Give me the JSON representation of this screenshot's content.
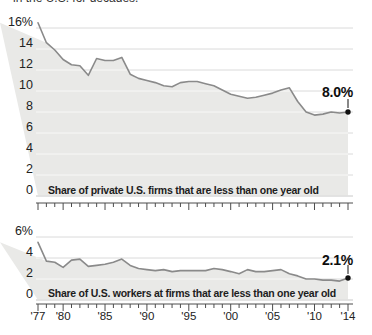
{
  "header": {
    "clipped_text": "in the U.S. for decades."
  },
  "colors": {
    "area_fill": "#e9e9e7",
    "line": "#8a8a8a",
    "grid": "#dadada",
    "grid_on_fill": "rgba(255,255,255,0.7)",
    "dot": "#111111",
    "axis": "#4d4d4d",
    "tick_text": "#222222",
    "label_text": "#1d1d1d"
  },
  "chart_data": [
    {
      "type": "area",
      "name": "firms-startup-share",
      "title": "Share of private U.S. firms that are less than one year old",
      "x": [
        1977,
        1978,
        1979,
        1980,
        1981,
        1982,
        1983,
        1984,
        1985,
        1986,
        1987,
        1988,
        1989,
        1990,
        1991,
        1992,
        1993,
        1994,
        1995,
        1996,
        1997,
        1998,
        1999,
        2000,
        2001,
        2002,
        2003,
        2004,
        2005,
        2006,
        2007,
        2008,
        2009,
        2010,
        2011,
        2012,
        2013,
        2014
      ],
      "values": [
        16.5,
        14.6,
        13.9,
        13.0,
        12.5,
        12.4,
        11.5,
        13.1,
        12.9,
        12.9,
        13.2,
        11.6,
        11.2,
        11.0,
        10.8,
        10.5,
        10.4,
        10.8,
        10.9,
        10.9,
        10.7,
        10.5,
        10.1,
        9.7,
        9.5,
        9.3,
        9.4,
        9.6,
        9.8,
        10.1,
        10.3,
        9.0,
        8.0,
        7.7,
        7.8,
        8.0,
        7.9,
        8.0
      ],
      "ylim": [
        0,
        17
      ],
      "yticks": [
        16,
        14,
        12,
        10,
        8,
        6,
        4,
        2,
        0
      ],
      "ytick_labels": [
        "16%",
        "14",
        "12",
        "10",
        "8",
        "6",
        "4",
        "2",
        "0"
      ],
      "xtick_years": [
        1977,
        1980,
        1985,
        1990,
        1995,
        2000,
        2005,
        2010,
        2014
      ],
      "xtick_labels": [
        "'77",
        "'80",
        "'85",
        "'90",
        "'95",
        "'00",
        "'05",
        "'10",
        "'14"
      ],
      "show_x_labels": false,
      "grid": true,
      "legend": "none",
      "end_annotation": {
        "label": "8.0%",
        "year": 2014,
        "value": 8.0
      }
    },
    {
      "type": "area",
      "name": "workers-startup-share",
      "title": "Share of U.S. workers at firms that are less than one year old",
      "x": [
        1977,
        1978,
        1979,
        1980,
        1981,
        1982,
        1983,
        1984,
        1985,
        1986,
        1987,
        1988,
        1989,
        1990,
        1991,
        1992,
        1993,
        1994,
        1995,
        1996,
        1997,
        1998,
        1999,
        2000,
        2001,
        2002,
        2003,
        2004,
        2005,
        2006,
        2007,
        2008,
        2009,
        2010,
        2011,
        2012,
        2013,
        2014
      ],
      "values": [
        5.5,
        3.7,
        3.6,
        3.1,
        3.8,
        3.9,
        3.2,
        3.3,
        3.4,
        3.6,
        3.9,
        3.3,
        3.0,
        2.9,
        2.8,
        2.9,
        2.7,
        2.8,
        2.8,
        2.8,
        2.8,
        3.0,
        2.9,
        2.7,
        2.5,
        2.9,
        2.7,
        2.7,
        2.8,
        2.9,
        2.5,
        2.3,
        2.0,
        2.0,
        1.9,
        1.9,
        1.8,
        2.1
      ],
      "ylim": [
        0,
        6
      ],
      "yticks": [
        6,
        4,
        2,
        0
      ],
      "ytick_labels": [
        "6%",
        "4",
        "2",
        "0"
      ],
      "xtick_years": [
        1977,
        1980,
        1985,
        1990,
        1995,
        2000,
        2005,
        2010,
        2014
      ],
      "xtick_labels": [
        "'77",
        "'80",
        "'85",
        "'90",
        "'95",
        "'00",
        "'05",
        "'10",
        "'14"
      ],
      "show_x_labels": true,
      "grid": true,
      "legend": "none",
      "end_annotation": {
        "label": "2.1%",
        "year": 2014,
        "value": 2.1
      }
    }
  ]
}
